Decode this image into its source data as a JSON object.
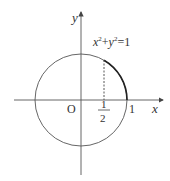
{
  "diagram": {
    "type": "unit-circle",
    "equation": {
      "x": "x",
      "sup1": "2",
      "plus": "+",
      "y": "y",
      "sup2": "2",
      "eq": "=1"
    },
    "axes": {
      "x_label": "x",
      "y_label": "y"
    },
    "origin_label": "O",
    "tick_one_label": "1",
    "half_numerator": "1",
    "half_denominator": "2",
    "highlighted_arc": "from x=1/2 to x=1 on upper half",
    "colors": {
      "stroke": "#444444",
      "text": "#333333"
    }
  }
}
